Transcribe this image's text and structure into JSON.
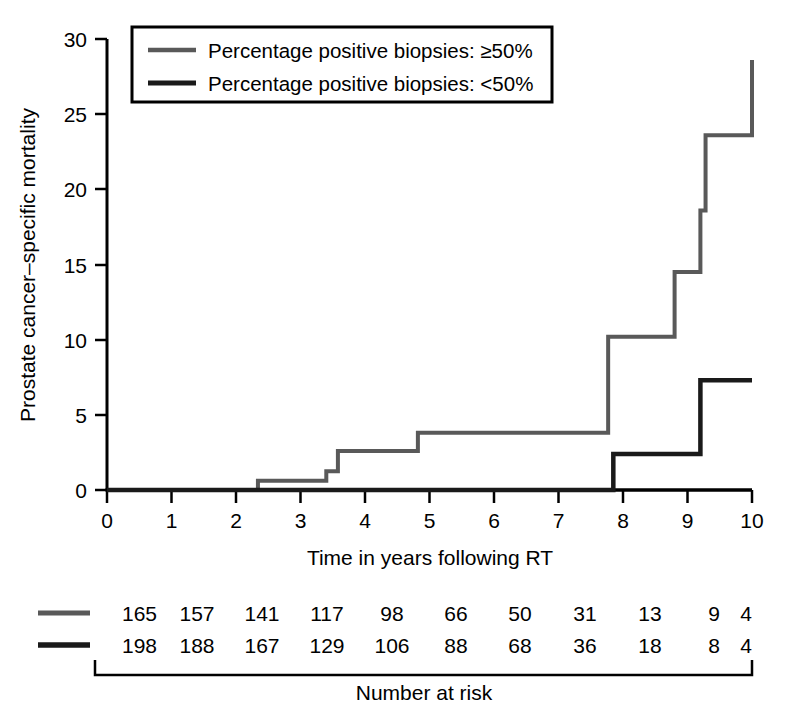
{
  "chart_data": {
    "type": "line",
    "subtype": "kaplan-meier-step",
    "title": "",
    "xlabel": "Time in years following RT",
    "ylabel": "Prostate cancer–specific mortality",
    "xlim": [
      0,
      10
    ],
    "ylim": [
      0,
      30
    ],
    "xticks": [
      0,
      1,
      2,
      3,
      4,
      5,
      6,
      7,
      8,
      9,
      10
    ],
    "xtick_labels": [
      "0",
      "1",
      "2",
      "3",
      "4",
      "5",
      "6",
      "7",
      "8",
      "9",
      "10"
    ],
    "yticks": [
      0,
      5,
      10,
      15,
      20,
      25,
      30
    ],
    "ytick_labels": [
      "0",
      "5",
      "10",
      "15",
      "20",
      "25",
      "30"
    ],
    "grid": false,
    "legend_position": "top-left",
    "series": [
      {
        "name": "Percentage positive biopsies: ≥50%",
        "color": "#595959",
        "step_points": [
          [
            0,
            0
          ],
          [
            2.34,
            0
          ],
          [
            2.34,
            0.62
          ],
          [
            3.4,
            0.62
          ],
          [
            3.4,
            1.25
          ],
          [
            3.58,
            1.25
          ],
          [
            3.58,
            2.6
          ],
          [
            4.82,
            2.6
          ],
          [
            4.82,
            3.8
          ],
          [
            7.77,
            3.8
          ],
          [
            7.77,
            10.2
          ],
          [
            8.8,
            10.2
          ],
          [
            8.8,
            14.5
          ],
          [
            9.2,
            14.5
          ],
          [
            9.2,
            18.6
          ],
          [
            9.28,
            18.6
          ],
          [
            9.28,
            23.6
          ],
          [
            10.0,
            23.6
          ],
          [
            10.0,
            28.6
          ]
        ]
      },
      {
        "name": "Percentage positive biopsies: <50%",
        "color": "#1a1a1a",
        "step_points": [
          [
            0,
            0
          ],
          [
            7.85,
            0
          ],
          [
            7.85,
            2.4
          ],
          [
            9.2,
            2.4
          ],
          [
            9.2,
            7.3
          ],
          [
            10.0,
            7.3
          ]
        ]
      }
    ]
  },
  "legend": {
    "entries": [
      {
        "label": "Percentage positive biopsies: ≥50%",
        "color": "#595959"
      },
      {
        "label": "Percentage positive biopsies: <50%",
        "color": "#1a1a1a"
      }
    ]
  },
  "risk_table": {
    "title": "Number at risk",
    "rows": [
      {
        "color": "#595959",
        "values": [
          "165",
          "157",
          "141",
          "117",
          "98",
          "66",
          "50",
          "31",
          "13",
          "9",
          "4"
        ]
      },
      {
        "color": "#1a1a1a",
        "values": [
          "198",
          "188",
          "167",
          "129",
          "106",
          "88",
          "68",
          "36",
          "18",
          "8",
          "4"
        ]
      }
    ]
  }
}
